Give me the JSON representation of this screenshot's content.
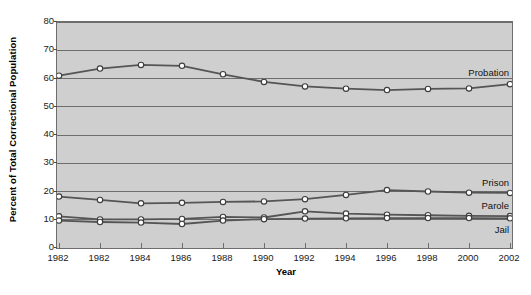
{
  "chart_data": {
    "type": "line",
    "title": "",
    "xlabel": "Year",
    "ylabel": "Percent of Total Correctional Population",
    "x": [
      1982,
      1982,
      1984,
      1986,
      1988,
      1990,
      1992,
      1994,
      1996,
      1998,
      2000,
      2002
    ],
    "xtick_labels": [
      "1982",
      "1982",
      "1984",
      "1986",
      "1988",
      "1990",
      "1992",
      "1994",
      "1996",
      "1998",
      "2000",
      "2002"
    ],
    "ytick_labels": [
      "0",
      "10",
      "20",
      "30",
      "40",
      "50",
      "60",
      "70",
      "80"
    ],
    "ytick_values": [
      0,
      10,
      20,
      30,
      40,
      50,
      60,
      70,
      80
    ],
    "ylim": [
      0,
      80
    ],
    "grid": "horizontal",
    "legend_position": "inline-right",
    "plot_background": "#cfcfcf",
    "line_color": "#555555",
    "marker_face": "#ffffff",
    "series": [
      {
        "name": "Probation",
        "values": [
          61.0,
          63.5,
          64.8,
          64.5,
          61.5,
          58.8,
          57.2,
          56.4,
          55.9,
          56.3,
          56.5,
          58.0
        ]
      },
      {
        "name": "Prison",
        "values": [
          18.2,
          17.0,
          15.8,
          16.0,
          16.3,
          16.5,
          17.3,
          18.8,
          20.5,
          20.0,
          19.6,
          19.5
        ]
      },
      {
        "name": "Parole",
        "values": [
          11.2,
          10.1,
          10.1,
          10.3,
          11.0,
          10.8,
          13.0,
          12.2,
          11.8,
          11.6,
          11.4,
          11.3
        ]
      },
      {
        "name": "Jail",
        "values": [
          9.7,
          9.2,
          9.0,
          8.5,
          9.7,
          10.2,
          10.4,
          10.5,
          10.6,
          10.6,
          10.6,
          10.5
        ]
      }
    ]
  }
}
